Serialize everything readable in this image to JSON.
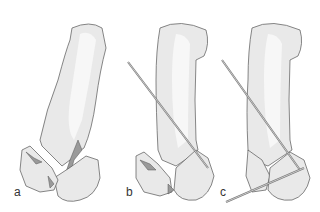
{
  "figure": {
    "panels": [
      {
        "id": "a",
        "label": "a",
        "description": "Displaced intra-articular fracture of thumb metacarpal base"
      },
      {
        "id": "b",
        "label": "b",
        "description": "Single K-wire inserted obliquely across metacarpal into base"
      },
      {
        "id": "c",
        "label": "c",
        "description": "Two K-wires: oblique wire plus transverse wire into trapezium/base fragment"
      }
    ],
    "colors": {
      "bone_fill": "#e9e9e9",
      "bone_highlight": "#f7f7f7",
      "outline": "#555555",
      "fracture_shade": "#9a9a9a",
      "wire": "#888888"
    }
  }
}
